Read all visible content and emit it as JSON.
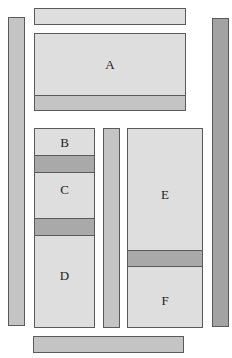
{
  "diagram": {
    "regions": [
      {
        "id": "A",
        "label": "A"
      },
      {
        "id": "B",
        "label": "B"
      },
      {
        "id": "C",
        "label": "C"
      },
      {
        "id": "D",
        "label": "D"
      },
      {
        "id": "E",
        "label": "E"
      },
      {
        "id": "F",
        "label": "F"
      }
    ],
    "colors": {
      "light_fill": "#dedede",
      "medium_fill": "#c4c4c4",
      "band_fill": "#a9a9a9",
      "dark_fill": "#a3a3a3",
      "border": "#5a5a5a"
    }
  }
}
